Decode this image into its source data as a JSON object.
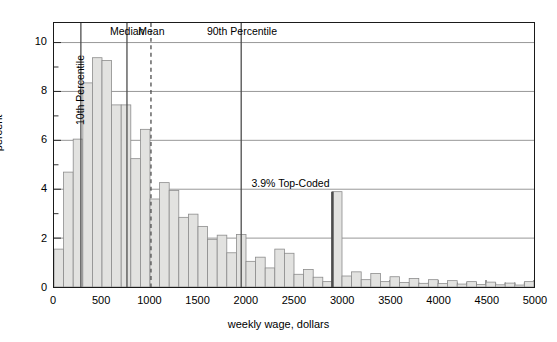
{
  "chart_data": {
    "type": "bar",
    "title": "",
    "subtitle": "",
    "xlabel": "weekly wage, dollars",
    "ylabel": "percent",
    "xlim": [
      0,
      5000
    ],
    "ylim": [
      0,
      10.8
    ],
    "grid": "horizontal-major",
    "legend_position": "none",
    "bin_width": 100,
    "bar_fill_color": "#e2e2e0",
    "bar_edge_color": "#8c8c8c",
    "axis_color": "#1a1a1a",
    "grid_color": "#8c8c8c",
    "marker_color": "#4d4d4d",
    "x_tick_labels": [
      "0",
      "500",
      "1000",
      "1500",
      "2000",
      "2500",
      "3000",
      "3500",
      "4000",
      "4500",
      "5000"
    ],
    "x_tick_values": [
      0,
      500,
      1000,
      1500,
      2000,
      2500,
      3000,
      3500,
      4000,
      4500,
      5000
    ],
    "x_minor_step": 100,
    "y_tick_labels": [
      "0",
      "2",
      "4",
      "6",
      "8",
      "10"
    ],
    "y_tick_values": [
      0,
      2,
      4,
      6,
      8,
      10
    ],
    "y_minor_values": [
      1,
      3,
      5,
      7,
      9
    ],
    "gridline_values": [
      2,
      4,
      6,
      8,
      10
    ],
    "bin_starts": [
      0,
      100,
      200,
      300,
      400,
      500,
      600,
      700,
      800,
      900,
      1000,
      1100,
      1200,
      1300,
      1400,
      1500,
      1600,
      1700,
      1800,
      1900,
      2000,
      2100,
      2200,
      2300,
      2400,
      2500,
      2600,
      2700,
      2800,
      2900,
      3000,
      3100,
      3200,
      3300,
      3400,
      3500,
      3600,
      3700,
      3800,
      3900,
      4000,
      4100,
      4200,
      4300,
      4400,
      4500,
      4600,
      4700,
      4800,
      4900
    ],
    "values": [
      1.55,
      4.7,
      6.05,
      8.35,
      9.38,
      9.27,
      7.45,
      7.45,
      5.25,
      6.45,
      3.6,
      4.27,
      3.95,
      2.85,
      2.98,
      2.48,
      1.95,
      2.12,
      1.4,
      2.15,
      1.05,
      1.22,
      0.78,
      1.55,
      1.38,
      0.52,
      0.72,
      0.4,
      0.22,
      3.9,
      0.45,
      0.62,
      0.3,
      0.55,
      0.22,
      0.42,
      0.18,
      0.35,
      0.15,
      0.3,
      0.14,
      0.26,
      0.12,
      0.22,
      0.1,
      0.2,
      0.09,
      0.16,
      0.08,
      0.22
    ],
    "annotations": [
      {
        "name": "10th-percentile",
        "label": "10th Percentile",
        "x": 280,
        "orientation": "vertical",
        "line_style": "solid"
      },
      {
        "name": "median",
        "label": "Median",
        "x": 760,
        "orientation": "horizontal",
        "line_style": "solid"
      },
      {
        "name": "mean",
        "label": "Mean",
        "x": 1010,
        "orientation": "horizontal",
        "line_style": "dashed"
      },
      {
        "name": "90th-percentile",
        "label": "90th Percentile",
        "x": 1950,
        "orientation": "horizontal",
        "line_style": "solid"
      },
      {
        "name": "top-coded",
        "label": "3.9% Top-Coded",
        "x": 2900,
        "orientation": "horizontal",
        "line_style": "spike",
        "value": 3.9
      }
    ]
  }
}
